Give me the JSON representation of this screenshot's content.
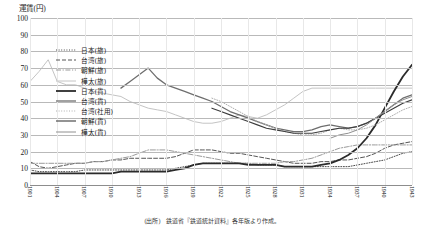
{
  "axis_title": "運賃(円)",
  "caption": "(出所)　鉄道省『鉄道統計資料』各年版より作成。",
  "legend": {
    "items": [
      {
        "label": "日本(旅)",
        "style": "dotted",
        "color": "#4a4a4a",
        "width": 1.0
      },
      {
        "label": "台湾(旅)",
        "style": "dashed",
        "color": "#555555",
        "width": 1.0
      },
      {
        "label": "朝鮮(旅)",
        "style": "dashdot",
        "color": "#9a9a9a",
        "width": 1.0
      },
      {
        "label": "樺太(旅)",
        "style": "solid",
        "color": "#c4c4c4",
        "width": 1.0
      },
      {
        "label": "日本(貨)",
        "style": "solid",
        "color": "#2b2b2b",
        "width": 1.8
      },
      {
        "label": "台湾(貨)",
        "style": "solid",
        "color": "#6e6e6e",
        "width": 1.3
      },
      {
        "label": "台湾(社用)",
        "style": "dotted",
        "color": "#b0b0b0",
        "width": 1.0
      },
      {
        "label": "朝鮮(貨)",
        "style": "solid",
        "color": "#3d3d3d",
        "width": 1.1
      },
      {
        "label": "樺太(貨)",
        "style": "solid",
        "color": "#909090",
        "width": 1.0
      }
    ]
  },
  "chart_data": {
    "type": "line",
    "title": "運賃(円)",
    "xlabel": "",
    "ylabel": "運賃(円)",
    "ylim": [
      0,
      100
    ],
    "ytick_step": 10,
    "yticks": [
      0,
      10,
      20,
      30,
      40,
      50,
      60,
      70,
      80,
      90,
      100
    ],
    "grid": true,
    "legend_position": "upper-left-inside",
    "x": [
      1901,
      1902,
      1903,
      1904,
      1905,
      1906,
      1907,
      1908,
      1909,
      1910,
      1911,
      1912,
      1913,
      1914,
      1915,
      1916,
      1917,
      1918,
      1919,
      1920,
      1921,
      1922,
      1923,
      1924,
      1925,
      1926,
      1927,
      1928,
      1929,
      1930,
      1931,
      1932,
      1933,
      1934,
      1935,
      1936,
      1937,
      1938,
      1939,
      1940,
      1941,
      1942,
      1943
    ],
    "xticklabels": [
      "1901",
      "1902",
      "1903",
      "1904",
      "1905",
      "1906",
      "1907",
      "1908",
      "1909",
      "1910",
      "1911",
      "1912",
      "1913",
      "1914",
      "1915",
      "1916",
      "1917",
      "1918",
      "1919",
      "1920",
      "1921",
      "1922",
      "1923",
      "1924",
      "1925",
      "1926",
      "1927",
      "1928",
      "1929",
      "1930",
      "1931",
      "1932",
      "1933",
      "1934",
      "1935",
      "1936",
      "1937",
      "1938",
      "1939",
      "1940",
      "1941",
      "1942",
      "1943"
    ],
    "xtick_every": 3,
    "series": [
      {
        "name": "日本(旅)",
        "values": [
          9,
          8,
          8,
          8,
          8,
          9,
          9,
          9,
          9,
          9,
          9,
          9,
          9,
          9,
          9,
          9,
          9,
          10,
          11,
          12,
          13,
          13,
          13,
          13,
          13,
          13,
          12,
          12,
          12,
          11,
          11,
          11,
          11,
          11,
          11,
          11,
          11,
          12,
          13,
          14,
          15,
          17,
          19
        ]
      },
      {
        "name": "台湾(旅)",
        "values": [
          14,
          11,
          10,
          11,
          12,
          13,
          13,
          14,
          14,
          15,
          15,
          16,
          16,
          16,
          16,
          16,
          16,
          17,
          19,
          21,
          21,
          21,
          20,
          19,
          19,
          18,
          17,
          16,
          15,
          14,
          13,
          13,
          13,
          14,
          14,
          15,
          15,
          16,
          17,
          19,
          22,
          24,
          25
        ]
      },
      {
        "name": "朝鮮(旅)",
        "values": [
          null,
          null,
          null,
          null,
          null,
          null,
          null,
          null,
          null,
          null,
          null,
          null,
          13,
          14,
          14,
          15,
          16,
          17,
          19,
          21,
          21,
          21,
          20,
          19,
          18,
          17,
          16,
          15,
          14,
          13,
          13,
          13,
          13,
          13,
          14,
          14,
          15,
          16,
          18,
          20,
          22,
          23,
          24
        ]
      },
      {
        "name": "樺太(旅)",
        "values": [
          null,
          null,
          null,
          null,
          null,
          null,
          null,
          null,
          null,
          null,
          11,
          62,
          68,
          75,
          62,
          60,
          60,
          58,
          56,
          55,
          54,
          53,
          50,
          48,
          46,
          45,
          44,
          42,
          40,
          38,
          37,
          37,
          38,
          40,
          42,
          41,
          40,
          42,
          45,
          48,
          52,
          56,
          58
        ]
      },
      {
        "name": "日本(貨)",
        "values": [
          null,
          null,
          null,
          null,
          null,
          null,
          null,
          null,
          null,
          null,
          null,
          null,
          null,
          null,
          null,
          null,
          null,
          null,
          null,
          null,
          null,
          null,
          null,
          null,
          null,
          null,
          null,
          null,
          null,
          null,
          null,
          null,
          null,
          null,
          null,
          null,
          null,
          null,
          null,
          null,
          null,
          null,
          null
        ]
      },
      {
        "name": "台湾(貨)",
        "values": [
          null,
          null,
          null,
          null,
          null,
          null,
          null,
          null,
          null,
          null,
          null,
          null,
          null,
          null,
          null,
          null,
          null,
          null,
          null,
          null,
          null,
          null,
          null,
          null,
          null,
          null,
          null,
          null,
          null,
          null,
          null,
          null,
          null,
          null,
          null,
          null,
          null,
          null,
          null,
          null,
          null,
          null,
          null
        ]
      },
      {
        "name": "台湾(社用)",
        "values": [
          null,
          null,
          null,
          null,
          null,
          null,
          null,
          null,
          null,
          null,
          null,
          null,
          null,
          null,
          null,
          null,
          null,
          null,
          null,
          null,
          null,
          null,
          null,
          null,
          null,
          null,
          null,
          null,
          null,
          null,
          null,
          null,
          null,
          null,
          null,
          null,
          null,
          null,
          null,
          null,
          null,
          null,
          null
        ]
      },
      {
        "name": "朝鮮(貨)",
        "values": [
          null,
          null,
          null,
          null,
          null,
          null,
          null,
          null,
          null,
          null,
          null,
          null,
          null,
          null,
          null,
          null,
          null,
          null,
          null,
          null,
          null,
          null,
          null,
          null,
          null,
          null,
          null,
          null,
          null,
          null,
          null,
          null,
          null,
          null,
          null,
          null,
          null,
          null,
          null,
          null,
          null,
          null,
          null
        ]
      },
      {
        "name": "樺太(貨)",
        "values": [
          null,
          null,
          null,
          null,
          null,
          null,
          null,
          null,
          null,
          null,
          null,
          null,
          null,
          null,
          null,
          null,
          null,
          null,
          null,
          null,
          null,
          null,
          null,
          null,
          null,
          null,
          null,
          null,
          null,
          null,
          null,
          null,
          null,
          null,
          null,
          null,
          null,
          null,
          null,
          null,
          null,
          null,
          null
        ]
      }
    ],
    "series_pixel_paths": {
      "日本(旅)": "9,8,8,8,8,8,9,9,9,9,9,9,9,9,9,9,10,11,12,13,13,13,13,13,13,12,12,12,11,11,11,11,11,11,11,11,12,13,14,15,17,19,20",
      "台湾(旅)": "14,11,10,11,12,13,13,14,14,15,15,16,16,16,16,16,17,19,21,21,21,20,19,19,18,17,16,15,14,13,13,13,14,14,15,15,16,17,19,22,24,25,26",
      "朝鮮(旅)": "13,13,13,13,13,13,13,14,14,15,16,17,19,21,21,21,20,19,18,17,16,15,14,13,13,13,13,13,14,14,15,16,18,20,22,23,24,24,24,24,24,24,24",
      "樺太(旅)": "62,68,75,62,60,60,58,56,55,54,53,50,48,46,45,44,42,40,38,37,37,38,40,42,41,40,42,45,48,52,56,58,58,58,58,58,58,58,58,58,58,58,58"
    }
  }
}
